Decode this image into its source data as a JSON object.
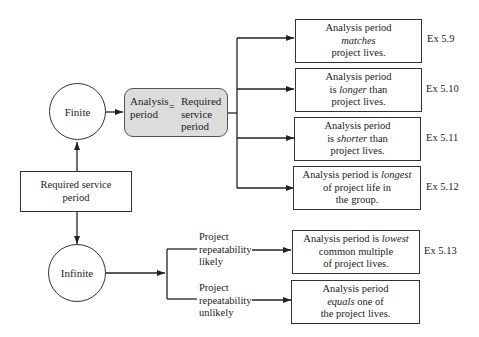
{
  "diagram": {
    "nodes": {
      "finite": "Finite",
      "infinite": "Infinite",
      "required_service": {
        "line1": "Required service",
        "line2": "period"
      },
      "equation": {
        "left_line1": "Analysis",
        "left_line2": "period",
        "equals": "=",
        "right_line1": "Required",
        "right_line2": "service",
        "right_line3": "period"
      }
    },
    "finite_outcomes": [
      {
        "pre": "Analysis period",
        "em": "matches",
        "post": "project lives.",
        "ex": "Ex 5.9"
      },
      {
        "pre": "Analysis period",
        "em_prefix": "is ",
        "em": "longer",
        "em_suffix": " than",
        "post": "project lives.",
        "ex": "Ex 5.10"
      },
      {
        "pre": "Analysis period",
        "em_prefix": "is ",
        "em": "shorter",
        "em_suffix": " than",
        "post": "project lives.",
        "ex": "Ex 5.11"
      },
      {
        "pre": "Analysis period is ",
        "em": "longest",
        "line2": "of project life in",
        "post": "the group.",
        "ex": "Ex 5.12"
      }
    ],
    "infinite_conditions": [
      {
        "line1": "Project",
        "line2": "repeatability",
        "line3": "likely"
      },
      {
        "line1": "Project",
        "line2": "repeatability",
        "line3": "unlikely"
      }
    ],
    "infinite_outcomes": [
      {
        "pre": "Analysis period is ",
        "em": "lowest",
        "line2": "common multiple",
        "post": "of project lives.",
        "ex": "Ex 5.13"
      },
      {
        "pre": "Analysis period",
        "em": "equals",
        "em_suffix": " one of",
        "post": "the project lives."
      }
    ]
  }
}
